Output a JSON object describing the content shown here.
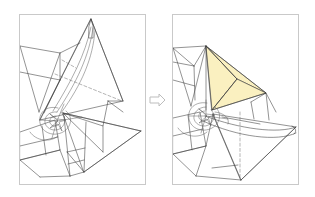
{
  "figure": {
    "kind": "two-step instruction diagram",
    "background_color": "#ffffff",
    "width": 315,
    "height": 197
  },
  "colors": {
    "panel_border": "#c9c9c9",
    "crease_line": "#3a3a3a",
    "crease_line_soft": "#5d5d5d",
    "dashed_crease": "#6a6a6a",
    "highlight_fill": "#faf0c0",
    "arrow_stroke": "#bdbdbd",
    "arrow_fill": "#ffffff",
    "background": "#ffffff"
  },
  "panels": [
    {
      "id": "before",
      "label": "Step 1 - model before fold",
      "x": 19,
      "y": 14,
      "width": 126,
      "height": 170,
      "highlighted_facets": 0,
      "has_dashed_creases": true,
      "has_spiral_center": true
    },
    {
      "id": "after",
      "label": "Step 2 - model after fold",
      "x": 172,
      "y": 14,
      "width": 126,
      "height": 170,
      "highlighted_facets": 2,
      "has_dashed_creases": true,
      "has_spiral_center": true
    }
  ],
  "arrow": {
    "name": "step-arrow",
    "glyph": "right-arrow-outline",
    "direction": "right",
    "x": 150,
    "y": 94,
    "width": 15,
    "height": 12
  },
  "annotations": {
    "text_labels": [],
    "numbers": [],
    "captions": []
  }
}
